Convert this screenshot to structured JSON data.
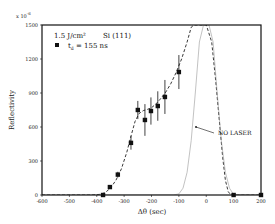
{
  "chart_data": {
    "type": "scatter",
    "title": "",
    "xlabel": "Δθ (sec)",
    "ylabel": "Reflectivity",
    "y_multiplier_label": "x 10",
    "y_multiplier_exp": "-6",
    "xlim": [
      -600,
      200
    ],
    "ylim": [
      0,
      1500
    ],
    "x_ticks": [
      -600,
      -500,
      -400,
      -300,
      -200,
      -100,
      0,
      100,
      200
    ],
    "y_ticks": [
      0,
      300,
      600,
      900,
      1200,
      1500
    ],
    "grid": false,
    "legend": {
      "position": "top-left",
      "line1_fluence": "1.5  J/cm²",
      "line1_sample": "Si (111)",
      "line2_symbol": "■",
      "line2_label": "t",
      "line2_sub": "d",
      "line2_value": " = 155  ns"
    },
    "annotations": [
      {
        "text": "NO LASER",
        "points_to_series": "no_laser"
      }
    ],
    "series": [
      {
        "name": "t_d = 155 ns (measured)",
        "style": "markers-with-errorbars",
        "marker": "filled-square",
        "x": [
          -377,
          -352,
          -323,
          -275,
          -250,
          -224,
          -202,
          -177,
          -151,
          -100,
          100,
          200
        ],
        "y": [
          0,
          70,
          180,
          460,
          750,
          662,
          741,
          785,
          865,
          1085,
          0,
          0
        ],
        "yerr": [
          0,
          15,
          25,
          60,
          80,
          140,
          120,
          130,
          150,
          150,
          0,
          0
        ]
      },
      {
        "name": "fit (dashed)",
        "style": "dashed-line",
        "x": [
          -600,
          -420,
          -390,
          -370,
          -350,
          -330,
          -310,
          -290,
          -275,
          -260,
          -245,
          -230,
          -215,
          -200,
          -185,
          -170,
          -150,
          -130,
          -110,
          -90,
          -70,
          -55,
          -45,
          0,
          20,
          35,
          50,
          60,
          70,
          80,
          90,
          200
        ],
        "y": [
          0,
          0,
          5,
          20,
          60,
          130,
          230,
          380,
          520,
          650,
          720,
          745,
          755,
          770,
          800,
          840,
          900,
          980,
          1080,
          1200,
          1350,
          1480,
          1500,
          1500,
          1350,
          1000,
          600,
          330,
          130,
          30,
          0,
          0
        ]
      },
      {
        "name": "no_laser",
        "style": "dotted-line",
        "x": [
          -600,
          -120,
          -100,
          -85,
          -70,
          -55,
          -40,
          -25,
          -10,
          0,
          10,
          25,
          40,
          55,
          70,
          85,
          100,
          200
        ],
        "y": [
          0,
          0,
          10,
          60,
          200,
          480,
          900,
          1350,
          1500,
          1500,
          1500,
          1350,
          900,
          480,
          200,
          60,
          5,
          0
        ]
      }
    ]
  }
}
